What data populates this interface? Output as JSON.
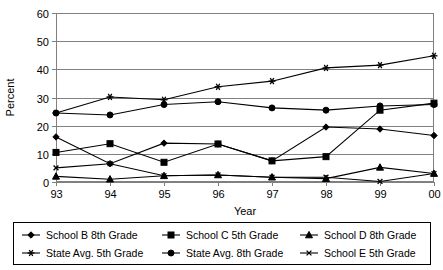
{
  "chart_data": {
    "type": "line",
    "title": "",
    "xlabel": "Year",
    "ylabel": "Percent",
    "categories": [
      "93",
      "94",
      "95",
      "96",
      "97",
      "98",
      "99",
      "00"
    ],
    "x": [
      "93",
      "94",
      "95",
      "96",
      "97",
      "98",
      "99",
      "00"
    ],
    "ylim": [
      0,
      60
    ],
    "yticks": [
      0,
      10,
      20,
      30,
      40,
      50,
      60
    ],
    "ytick_labels": [
      "0",
      "10",
      "20",
      "30",
      "40",
      "50",
      "60"
    ],
    "grid": "horizontal",
    "legend_position": "bottom",
    "series": [
      {
        "name": "School B 8th Grade",
        "marker": "diamond",
        "values": [
          16.0,
          6.5,
          13.8,
          13.5,
          7.5,
          19.5,
          18.8,
          16.5
        ]
      },
      {
        "name": "School C 5th Grade",
        "marker": "square",
        "values": [
          10.5,
          13.6,
          7.0,
          13.5,
          7.5,
          9.0,
          25.5,
          28.0
        ]
      },
      {
        "name": "School D 8th Grade",
        "marker": "triangle",
        "values": [
          2.0,
          1.0,
          2.2,
          2.5,
          1.7,
          1.2,
          5.2,
          3.0
        ]
      },
      {
        "name": "State Avg. 5th Grade",
        "marker": "asterisk",
        "values": [
          24.5,
          30.2,
          29.2,
          33.8,
          35.8,
          40.5,
          41.5,
          44.8
        ]
      },
      {
        "name": "State Avg. 8th Grade",
        "marker": "circle",
        "values": [
          24.5,
          23.8,
          27.5,
          28.5,
          26.3,
          25.5,
          27.0,
          27.5
        ]
      },
      {
        "name": "School E 5th Grade",
        "marker": "cross",
        "values": [
          5.0,
          6.5,
          2.2,
          2.5,
          1.7,
          1.7,
          0.2,
          3.0
        ]
      }
    ]
  },
  "legend": {
    "entries": [
      {
        "label": "School B 8th Grade",
        "marker": "diamond"
      },
      {
        "label": "School C 5th Grade",
        "marker": "square"
      },
      {
        "label": "School D 8th Grade",
        "marker": "triangle"
      },
      {
        "label": "State Avg. 5th Grade",
        "marker": "asterisk"
      },
      {
        "label": "State Avg. 8th Grade",
        "marker": "circle"
      },
      {
        "label": "School E 5th Grade",
        "marker": "cross"
      }
    ]
  },
  "colors": {
    "series": "#000000",
    "grid": "#808080",
    "background": "#ffffff",
    "text": "#000000"
  }
}
